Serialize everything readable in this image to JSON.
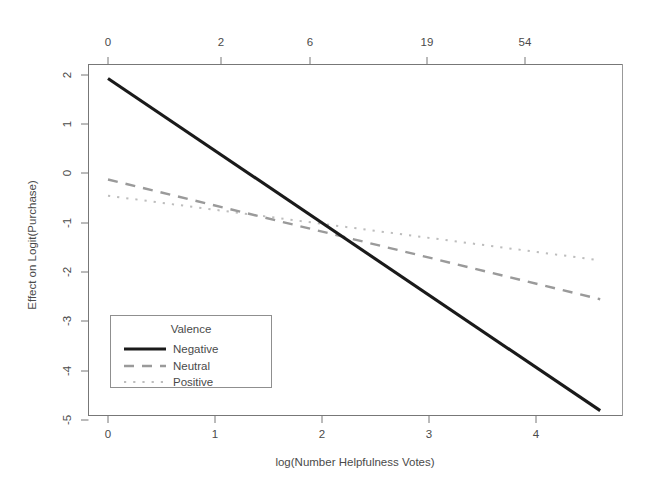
{
  "chart_data": {
    "type": "line",
    "title": "",
    "xlabel": "log(Number Helpfulness Votes)",
    "ylabel": "Effect on Logit(Purchase)",
    "xlim": [
      -0.18,
      4.98
    ],
    "ylim": [
      -5.3,
      2.3
    ],
    "grid": false,
    "legend_position": "bottom-left",
    "legend_title": "Valence",
    "x_ticks": [
      "0",
      "1",
      "2",
      "3",
      "4"
    ],
    "x_tick_values": [
      0,
      1,
      2,
      3,
      4
    ],
    "y_ticks": [
      "2",
      "1",
      "0",
      "-1",
      "-2",
      "-3",
      "-4",
      "-5"
    ],
    "y_tick_values": [
      2,
      1,
      0,
      -1,
      -2,
      -3,
      -4,
      -5
    ],
    "top_axis_label": "",
    "top_ticks": [
      "0",
      "2",
      "6",
      "19",
      "54"
    ],
    "top_tick_values": [
      0.0,
      1.06,
      1.89,
      2.98,
      3.9
    ],
    "x": [
      0.0,
      4.6
    ],
    "series": [
      {
        "name": "Negative",
        "style": "solid",
        "color": "#1a1a1a",
        "values": [
          1.93,
          -4.81
        ],
        "slope": -1.466,
        "intercept": 1.93
      },
      {
        "name": "Neutral",
        "style": "dashed",
        "color": "#9a9a9a",
        "values": [
          -0.12,
          -2.55
        ],
        "slope": -0.528,
        "intercept": -0.12
      },
      {
        "name": "Positive",
        "style": "dotted",
        "color": "#bdbdbd",
        "values": [
          -0.45,
          -1.76
        ],
        "slope": -0.285,
        "intercept": -0.45
      }
    ]
  },
  "figure": {
    "background": "#ffffff",
    "frame_color": "#999999",
    "axis_color": "#777777",
    "text_color": "#4a4a4a"
  },
  "legend": {
    "title": "Valence",
    "entries": [
      {
        "label": "Negative",
        "key": "solid-line-key"
      },
      {
        "label": "Neutral",
        "key": "dashed-line-key"
      },
      {
        "label": "Positive",
        "key": "dotted-line-key"
      }
    ]
  },
  "axes": {
    "x_title": "log(Number Helpfulness Votes)",
    "y_title": "Effect on Logit(Purchase)"
  }
}
